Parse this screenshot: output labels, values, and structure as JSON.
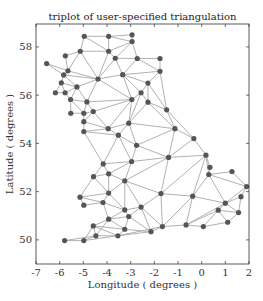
{
  "chart_data": {
    "type": "triplot",
    "title": "triplot of user-specified triangulation",
    "xlabel": "Longitude ( degrees )",
    "ylabel": "Latitude ( degrees )",
    "xlim": [
      -7,
      2
    ],
    "ylim": [
      49.0,
      58.95
    ],
    "xticks": [
      -7,
      -6,
      -5,
      -4,
      -3,
      -2,
      -1,
      0,
      1,
      2
    ],
    "xtick_labels": [
      "-7",
      "-6",
      "-5",
      "-4",
      "-3",
      "-2",
      "-1",
      "0",
      "1",
      "2"
    ],
    "yticks": [
      50,
      52,
      54,
      56,
      58
    ],
    "ytick_labels": [
      "50",
      "52",
      "54",
      "56",
      "58"
    ],
    "grid": false,
    "line_color": "#a8a8a8",
    "marker_color": "#555555",
    "points": [
      [
        -4.96,
        58.44
      ],
      [
        -3.93,
        58.44
      ],
      [
        -2.94,
        58.5
      ],
      [
        -2.94,
        58.22
      ],
      [
        -5.13,
        57.82
      ],
      [
        -3.93,
        57.82
      ],
      [
        -5.76,
        57.63
      ],
      [
        -3.65,
        57.53
      ],
      [
        -2.72,
        57.52
      ],
      [
        -1.76,
        57.52
      ],
      [
        -1.76,
        56.99
      ],
      [
        -6.55,
        57.31
      ],
      [
        -5.65,
        57.01
      ],
      [
        -5.83,
        56.84
      ],
      [
        -4.38,
        56.67
      ],
      [
        -3.34,
        56.85
      ],
      [
        -2.27,
        56.5
      ],
      [
        -5.93,
        56.51
      ],
      [
        -5.27,
        56.34
      ],
      [
        -6.18,
        56.1
      ],
      [
        -5.77,
        56.1
      ],
      [
        -5.54,
        55.82
      ],
      [
        -4.85,
        55.72
      ],
      [
        -2.95,
        55.82
      ],
      [
        -2.56,
        56.1
      ],
      [
        -2.27,
        55.71
      ],
      [
        -1.48,
        55.39
      ],
      [
        -5.53,
        55.25
      ],
      [
        -4.98,
        55.25
      ],
      [
        -4.58,
        55.32
      ],
      [
        -4.98,
        54.9
      ],
      [
        -4.98,
        54.49
      ],
      [
        -3.95,
        54.61
      ],
      [
        -3.08,
        54.84
      ],
      [
        -3.52,
        54.34
      ],
      [
        -2.75,
        53.92
      ],
      [
        -1.13,
        54.61
      ],
      [
        -0.33,
        54.2
      ],
      [
        -4.16,
        53.15
      ],
      [
        -2.96,
        53.25
      ],
      [
        -1.4,
        53.42
      ],
      [
        0.18,
        53.51
      ],
      [
        0.35,
        53.01
      ],
      [
        0.3,
        52.71
      ],
      [
        1.28,
        52.83
      ],
      [
        1.9,
        52.21
      ],
      [
        1.66,
        51.79
      ],
      [
        -4.57,
        52.62
      ],
      [
        -3.93,
        52.74
      ],
      [
        -3.25,
        52.45
      ],
      [
        -3.93,
        51.94
      ],
      [
        -5.14,
        51.77
      ],
      [
        -4.98,
        51.44
      ],
      [
        -4.17,
        51.55
      ],
      [
        -3.25,
        51.24
      ],
      [
        -2.56,
        51.36
      ],
      [
        -1.72,
        51.92
      ],
      [
        -0.38,
        51.81
      ],
      [
        1.0,
        51.52
      ],
      [
        0.7,
        51.23
      ],
      [
        1.56,
        51.13
      ],
      [
        1.1,
        50.73
      ],
      [
        -3.93,
        50.86
      ],
      [
        -3.08,
        50.97
      ],
      [
        -4.58,
        50.58
      ],
      [
        -3.25,
        50.44
      ],
      [
        -2.14,
        50.34
      ],
      [
        -1.66,
        50.55
      ],
      [
        -0.66,
        50.62
      ],
      [
        0.07,
        50.55
      ],
      [
        -4.47,
        50.17
      ],
      [
        -3.54,
        50.17
      ],
      [
        -4.98,
        49.97
      ],
      [
        -5.79,
        49.97
      ]
    ],
    "triangles": [
      [
        0,
        1,
        5
      ],
      [
        0,
        4,
        5
      ],
      [
        1,
        2,
        3
      ],
      [
        1,
        3,
        5
      ],
      [
        3,
        5,
        7
      ],
      [
        3,
        7,
        8
      ],
      [
        4,
        6,
        12
      ],
      [
        4,
        12,
        14
      ],
      [
        4,
        5,
        14
      ],
      [
        5,
        7,
        14
      ],
      [
        7,
        14,
        15
      ],
      [
        7,
        8,
        15
      ],
      [
        8,
        9,
        10
      ],
      [
        8,
        10,
        15
      ],
      [
        10,
        15,
        16
      ],
      [
        11,
        12,
        13
      ],
      [
        12,
        13,
        14
      ],
      [
        13,
        14,
        18
      ],
      [
        13,
        17,
        18
      ],
      [
        17,
        19,
        20
      ],
      [
        17,
        18,
        20
      ],
      [
        18,
        20,
        21
      ],
      [
        18,
        21,
        22
      ],
      [
        18,
        14,
        22
      ],
      [
        14,
        22,
        23
      ],
      [
        14,
        15,
        23
      ],
      [
        15,
        23,
        24
      ],
      [
        15,
        16,
        24
      ],
      [
        16,
        24,
        25
      ],
      [
        16,
        10,
        26
      ],
      [
        16,
        25,
        26
      ],
      [
        21,
        22,
        28
      ],
      [
        21,
        27,
        28
      ],
      [
        22,
        28,
        29
      ],
      [
        22,
        23,
        29
      ],
      [
        23,
        29,
        32
      ],
      [
        23,
        33,
        32
      ],
      [
        23,
        24,
        33
      ],
      [
        24,
        25,
        33
      ],
      [
        25,
        26,
        36
      ],
      [
        25,
        33,
        36
      ],
      [
        28,
        29,
        30
      ],
      [
        29,
        30,
        32
      ],
      [
        30,
        31,
        32
      ],
      [
        31,
        32,
        34
      ],
      [
        32,
        33,
        34
      ],
      [
        33,
        34,
        35
      ],
      [
        33,
        35,
        36
      ],
      [
        26,
        36,
        37
      ],
      [
        35,
        36,
        40
      ],
      [
        36,
        37,
        40
      ],
      [
        37,
        40,
        41
      ],
      [
        34,
        35,
        39
      ],
      [
        35,
        39,
        40
      ],
      [
        31,
        34,
        38
      ],
      [
        34,
        38,
        39
      ],
      [
        38,
        47,
        48
      ],
      [
        38,
        39,
        48
      ],
      [
        39,
        48,
        49
      ],
      [
        39,
        40,
        49
      ],
      [
        40,
        41,
        56
      ],
      [
        40,
        49,
        56
      ],
      [
        41,
        42,
        43
      ],
      [
        41,
        43,
        57
      ],
      [
        41,
        56,
        57
      ],
      [
        43,
        44,
        45
      ],
      [
        43,
        45,
        58
      ],
      [
        43,
        57,
        58
      ],
      [
        45,
        46,
        58
      ],
      [
        46,
        58,
        60
      ],
      [
        48,
        49,
        50
      ],
      [
        47,
        48,
        50
      ],
      [
        47,
        51,
        50
      ],
      [
        51,
        52,
        53
      ],
      [
        51,
        53,
        50
      ],
      [
        53,
        50,
        54
      ],
      [
        49,
        50,
        54
      ],
      [
        49,
        54,
        55
      ],
      [
        49,
        55,
        56
      ],
      [
        55,
        56,
        67
      ],
      [
        56,
        57,
        67
      ],
      [
        57,
        58,
        68
      ],
      [
        57,
        67,
        68
      ],
      [
        58,
        59,
        60
      ],
      [
        58,
        59,
        68
      ],
      [
        59,
        60,
        61
      ],
      [
        59,
        61,
        69
      ],
      [
        59,
        68,
        69
      ],
      [
        53,
        54,
        62
      ],
      [
        54,
        62,
        63
      ],
      [
        54,
        55,
        63
      ],
      [
        55,
        63,
        66
      ],
      [
        55,
        66,
        67
      ],
      [
        62,
        63,
        65
      ],
      [
        62,
        64,
        65
      ],
      [
        64,
        65,
        71
      ],
      [
        64,
        70,
        71
      ],
      [
        62,
        64,
        70
      ],
      [
        65,
        66,
        71
      ],
      [
        63,
        65,
        66
      ],
      [
        66,
        67,
        71
      ],
      [
        70,
        72,
        73
      ],
      [
        70,
        71,
        72
      ],
      [
        64,
        70,
        72
      ]
    ]
  }
}
